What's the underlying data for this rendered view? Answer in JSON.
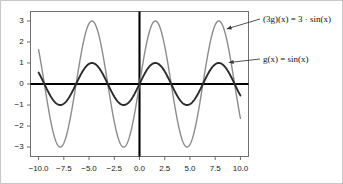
{
  "chart_data": {
    "type": "line",
    "title": "",
    "xlabel": "",
    "ylabel": "",
    "xlim": [
      -10.8,
      10.8
    ],
    "ylim": [
      -3.45,
      3.45
    ],
    "grid": false,
    "legend_position": "right-annotations",
    "xticks": [
      -10.0,
      -7.5,
      -5.0,
      -2.5,
      0.0,
      2.5,
      5.0,
      7.5,
      10.0
    ],
    "xtick_labels": [
      "-10.0",
      "-7.5",
      "-5.0",
      "-2.5",
      "0.0",
      "2.5",
      "5.0",
      "7.5",
      "10.0"
    ],
    "yticks": [
      3,
      2,
      1,
      0,
      -1,
      -2,
      -3
    ],
    "ytick_labels": [
      "3",
      "2",
      "1",
      "0",
      "-1",
      "-2",
      "-3"
    ],
    "axis_lines": {
      "x_axis_at_y": 0,
      "y_axis_at_x": 0
    },
    "series": [
      {
        "name": "(3g)(x) = 3 sin(x)",
        "expression": "3*sin(x)",
        "amplitude": 3,
        "period": 6.283185307179586,
        "color": "#8c8c8c",
        "width": 1.4,
        "label_parts": {
          "prefix": "(3",
          "fn": "g",
          "arg": ")(x) = 3 · sin(x)"
        },
        "label_text": "(3g)(x) = 3 · sin(x)",
        "sample_points": [
          {
            "x": -10.0,
            "y": 1.63
          },
          {
            "x": -9.42,
            "y": 0.0
          },
          {
            "x": -7.85,
            "y": -3.0
          },
          {
            "x": -6.28,
            "y": 0.0
          },
          {
            "x": -4.71,
            "y": 3.0
          },
          {
            "x": -3.14,
            "y": 0.0
          },
          {
            "x": -1.57,
            "y": -3.0
          },
          {
            "x": 0.0,
            "y": 0.0
          },
          {
            "x": 1.57,
            "y": 3.0
          },
          {
            "x": 3.14,
            "y": 0.0
          },
          {
            "x": 4.71,
            "y": -3.0
          },
          {
            "x": 6.28,
            "y": 0.0
          },
          {
            "x": 7.85,
            "y": 3.0
          },
          {
            "x": 9.42,
            "y": 0.0
          },
          {
            "x": 10.0,
            "y": -1.63
          }
        ]
      },
      {
        "name": "g(x) = sin(x)",
        "expression": "sin(x)",
        "amplitude": 1,
        "period": 6.283185307179586,
        "color": "#2b2b2b",
        "width": 1.9,
        "label_parts": {
          "prefix": "",
          "fn": "g",
          "arg": "(x) = sin(x)"
        },
        "label_text": "g(x) = sin(x)",
        "sample_points": [
          {
            "x": -10.0,
            "y": 0.54
          },
          {
            "x": -9.42,
            "y": 0.0
          },
          {
            "x": -7.85,
            "y": -1.0
          },
          {
            "x": -6.28,
            "y": 0.0
          },
          {
            "x": -4.71,
            "y": 1.0
          },
          {
            "x": -3.14,
            "y": 0.0
          },
          {
            "x": -1.57,
            "y": -1.0
          },
          {
            "x": 0.0,
            "y": 0.0
          },
          {
            "x": 1.57,
            "y": 1.0
          },
          {
            "x": 3.14,
            "y": 0.0
          },
          {
            "x": 4.71,
            "y": -1.0
          },
          {
            "x": 6.28,
            "y": 0.0
          },
          {
            "x": 7.85,
            "y": 1.0
          },
          {
            "x": 9.42,
            "y": 0.0
          },
          {
            "x": 10.0,
            "y": -0.54
          }
        ]
      }
    ],
    "annotations": [
      {
        "text": "(3g)(x) = 3 · sin(x)",
        "points_to": {
          "x": 8.4,
          "y": 2.55
        },
        "series": 0
      },
      {
        "text": "g(x) = sin(x)",
        "points_to": {
          "x": 8.6,
          "y": 0.95
        },
        "series": 1
      }
    ]
  },
  "labels": {
    "annotation_3g": "(3g)(x) = 3 · sin(x)",
    "annotation_g": "g(x) = sin(x)"
  },
  "colors": {
    "background": "#ffffff",
    "frame": "#6e6e6e",
    "axis": "#000000",
    "curve_scaled": "#8c8c8c",
    "curve_base": "#2b2b2b",
    "text": "#1a1a1a",
    "outer_border": "#c8c8c8"
  }
}
